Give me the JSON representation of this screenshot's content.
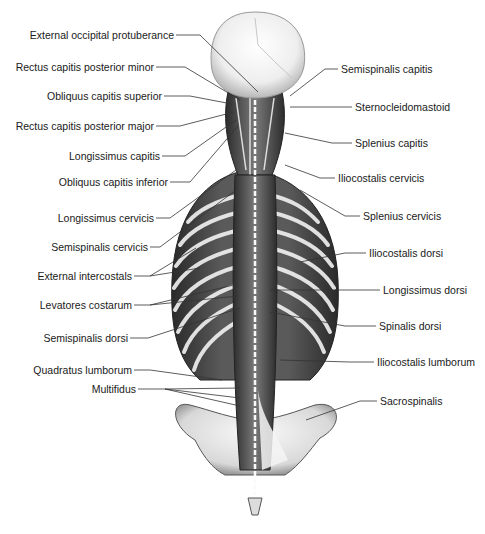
{
  "figure": {
    "colors": {
      "background": "#ffffff",
      "muscle_dark": "#3a3a3a",
      "muscle_mid": "#8a8a8a",
      "bone": "#ececec",
      "leader": "#333333",
      "text": "#1a1a1a"
    }
  },
  "labels": {
    "left": [
      {
        "text": "External occipital protuberance",
        "x": 172,
        "y": 35
      },
      {
        "text": "Rectus capitis posterior minor",
        "x": 152,
        "y": 67
      },
      {
        "text": "Obliquus capitis superior",
        "x": 160,
        "y": 96
      },
      {
        "text": "Rectus capitis posterior major",
        "x": 152,
        "y": 126
      },
      {
        "text": "Longissimus capitis",
        "x": 158,
        "y": 156
      },
      {
        "text": "Obliquus capitis inferior",
        "x": 166,
        "y": 182
      },
      {
        "text": "Longissimus cervicis",
        "x": 152,
        "y": 218
      },
      {
        "text": "Semispinalis cervicis",
        "x": 146,
        "y": 247
      },
      {
        "text": "External intercostals",
        "x": 130,
        "y": 276
      },
      {
        "text": "Levatores costarum",
        "x": 130,
        "y": 305
      },
      {
        "text": "Semispinalis dorsi",
        "x": 126,
        "y": 338
      },
      {
        "text": "Quadratus lumborum",
        "x": 130,
        "y": 370
      },
      {
        "text": "Multifidus",
        "x": 134,
        "y": 389
      }
    ],
    "right": [
      {
        "text": "Semispinalis capitis",
        "x": 341,
        "y": 69
      },
      {
        "text": "Sternocleidomastoid",
        "x": 355,
        "y": 107
      },
      {
        "text": "Splenius capitis",
        "x": 355,
        "y": 143
      },
      {
        "text": "Iliocostalis cervicis",
        "x": 338,
        "y": 178
      },
      {
        "text": "Splenius cervicis",
        "x": 363,
        "y": 216
      },
      {
        "text": "Iliocostalis dorsi",
        "x": 369,
        "y": 253
      },
      {
        "text": "Longissimus dorsi",
        "x": 383,
        "y": 290
      },
      {
        "text": "Spinalis dorsi",
        "x": 379,
        "y": 326
      },
      {
        "text": "Iliocostalis lumborum",
        "x": 377,
        "y": 362
      },
      {
        "text": "Sacrospinalis",
        "x": 380,
        "y": 401
      }
    ]
  }
}
